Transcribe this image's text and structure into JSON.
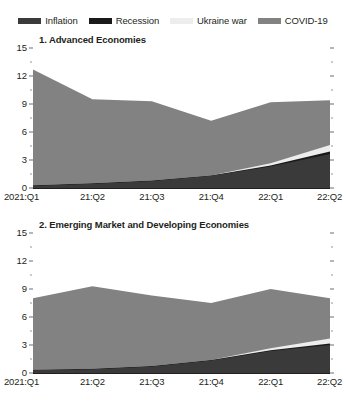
{
  "legend": {
    "items": [
      {
        "label": "Inflation",
        "color": "#3a3a3a"
      },
      {
        "label": "Recession",
        "color": "#1a1a1a"
      },
      {
        "label": "Ukraine war",
        "color": "#ededed"
      },
      {
        "label": "COVID-19",
        "color": "#828282"
      }
    ]
  },
  "chart_data": [
    {
      "type": "area",
      "stacked": true,
      "title": "1. Advanced Economies",
      "xlabel": "",
      "ylabel": "",
      "ylim": [
        0,
        15
      ],
      "yticks": [
        0,
        3,
        6,
        9,
        12,
        15
      ],
      "yticks_minor": [
        1.5,
        4.5,
        7.5,
        10.5,
        13.5
      ],
      "grid": false,
      "legend_position": "top",
      "categories": [
        "2021:Q1",
        "21:Q2",
        "21:Q3",
        "21:Q4",
        "22:Q1",
        "22:Q2"
      ],
      "series": [
        {
          "name": "Inflation",
          "color": "#3a3a3a",
          "values": [
            0.25,
            0.45,
            0.75,
            1.3,
            2.3,
            3.65
          ]
        },
        {
          "name": "Recession",
          "color": "#1a1a1a",
          "values": [
            0.05,
            0.05,
            0.05,
            0.05,
            0.1,
            0.25
          ]
        },
        {
          "name": "Ukraine war",
          "color": "#ededed",
          "values": [
            0.0,
            0.0,
            0.0,
            0.0,
            0.25,
            0.7
          ]
        },
        {
          "name": "COVID-19",
          "color": "#828282",
          "values": [
            12.4,
            9.0,
            8.5,
            5.85,
            6.55,
            4.8
          ]
        }
      ],
      "totals": [
        12.7,
        9.5,
        9.3,
        7.2,
        9.2,
        9.4
      ]
    },
    {
      "type": "area",
      "stacked": true,
      "title": "2. Emerging Market and Developing Economies",
      "xlabel": "",
      "ylabel": "",
      "ylim": [
        0,
        15
      ],
      "yticks": [
        0,
        3,
        6,
        9,
        12,
        15
      ],
      "yticks_minor": [
        1.5,
        4.5,
        7.5,
        10.5,
        13.5
      ],
      "grid": false,
      "legend_position": "top",
      "categories": [
        "2021:Q1",
        "21:Q2",
        "21:Q3",
        "21:Q4",
        "22:Q1",
        "22:Q2"
      ],
      "series": [
        {
          "name": "Inflation",
          "color": "#3a3a3a",
          "values": [
            0.3,
            0.4,
            0.7,
            1.35,
            2.35,
            3.0
          ]
        },
        {
          "name": "Recession",
          "color": "#1a1a1a",
          "values": [
            0.05,
            0.05,
            0.05,
            0.05,
            0.1,
            0.15
          ]
        },
        {
          "name": "Ukraine war",
          "color": "#ededed",
          "values": [
            0.0,
            0.0,
            0.0,
            0.0,
            0.2,
            0.55
          ]
        },
        {
          "name": "COVID-19",
          "color": "#828282",
          "values": [
            7.65,
            8.85,
            7.55,
            6.1,
            6.35,
            4.3
          ]
        }
      ],
      "totals": [
        8.0,
        9.3,
        8.3,
        7.5,
        9.0,
        8.0
      ]
    }
  ]
}
